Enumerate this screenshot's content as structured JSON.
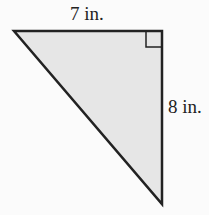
{
  "diagram": {
    "type": "right-triangle",
    "labels": {
      "top": "7 in.",
      "right": "8 in."
    },
    "fill_color": "#e6e6e6",
    "stroke_color": "#222222"
  }
}
